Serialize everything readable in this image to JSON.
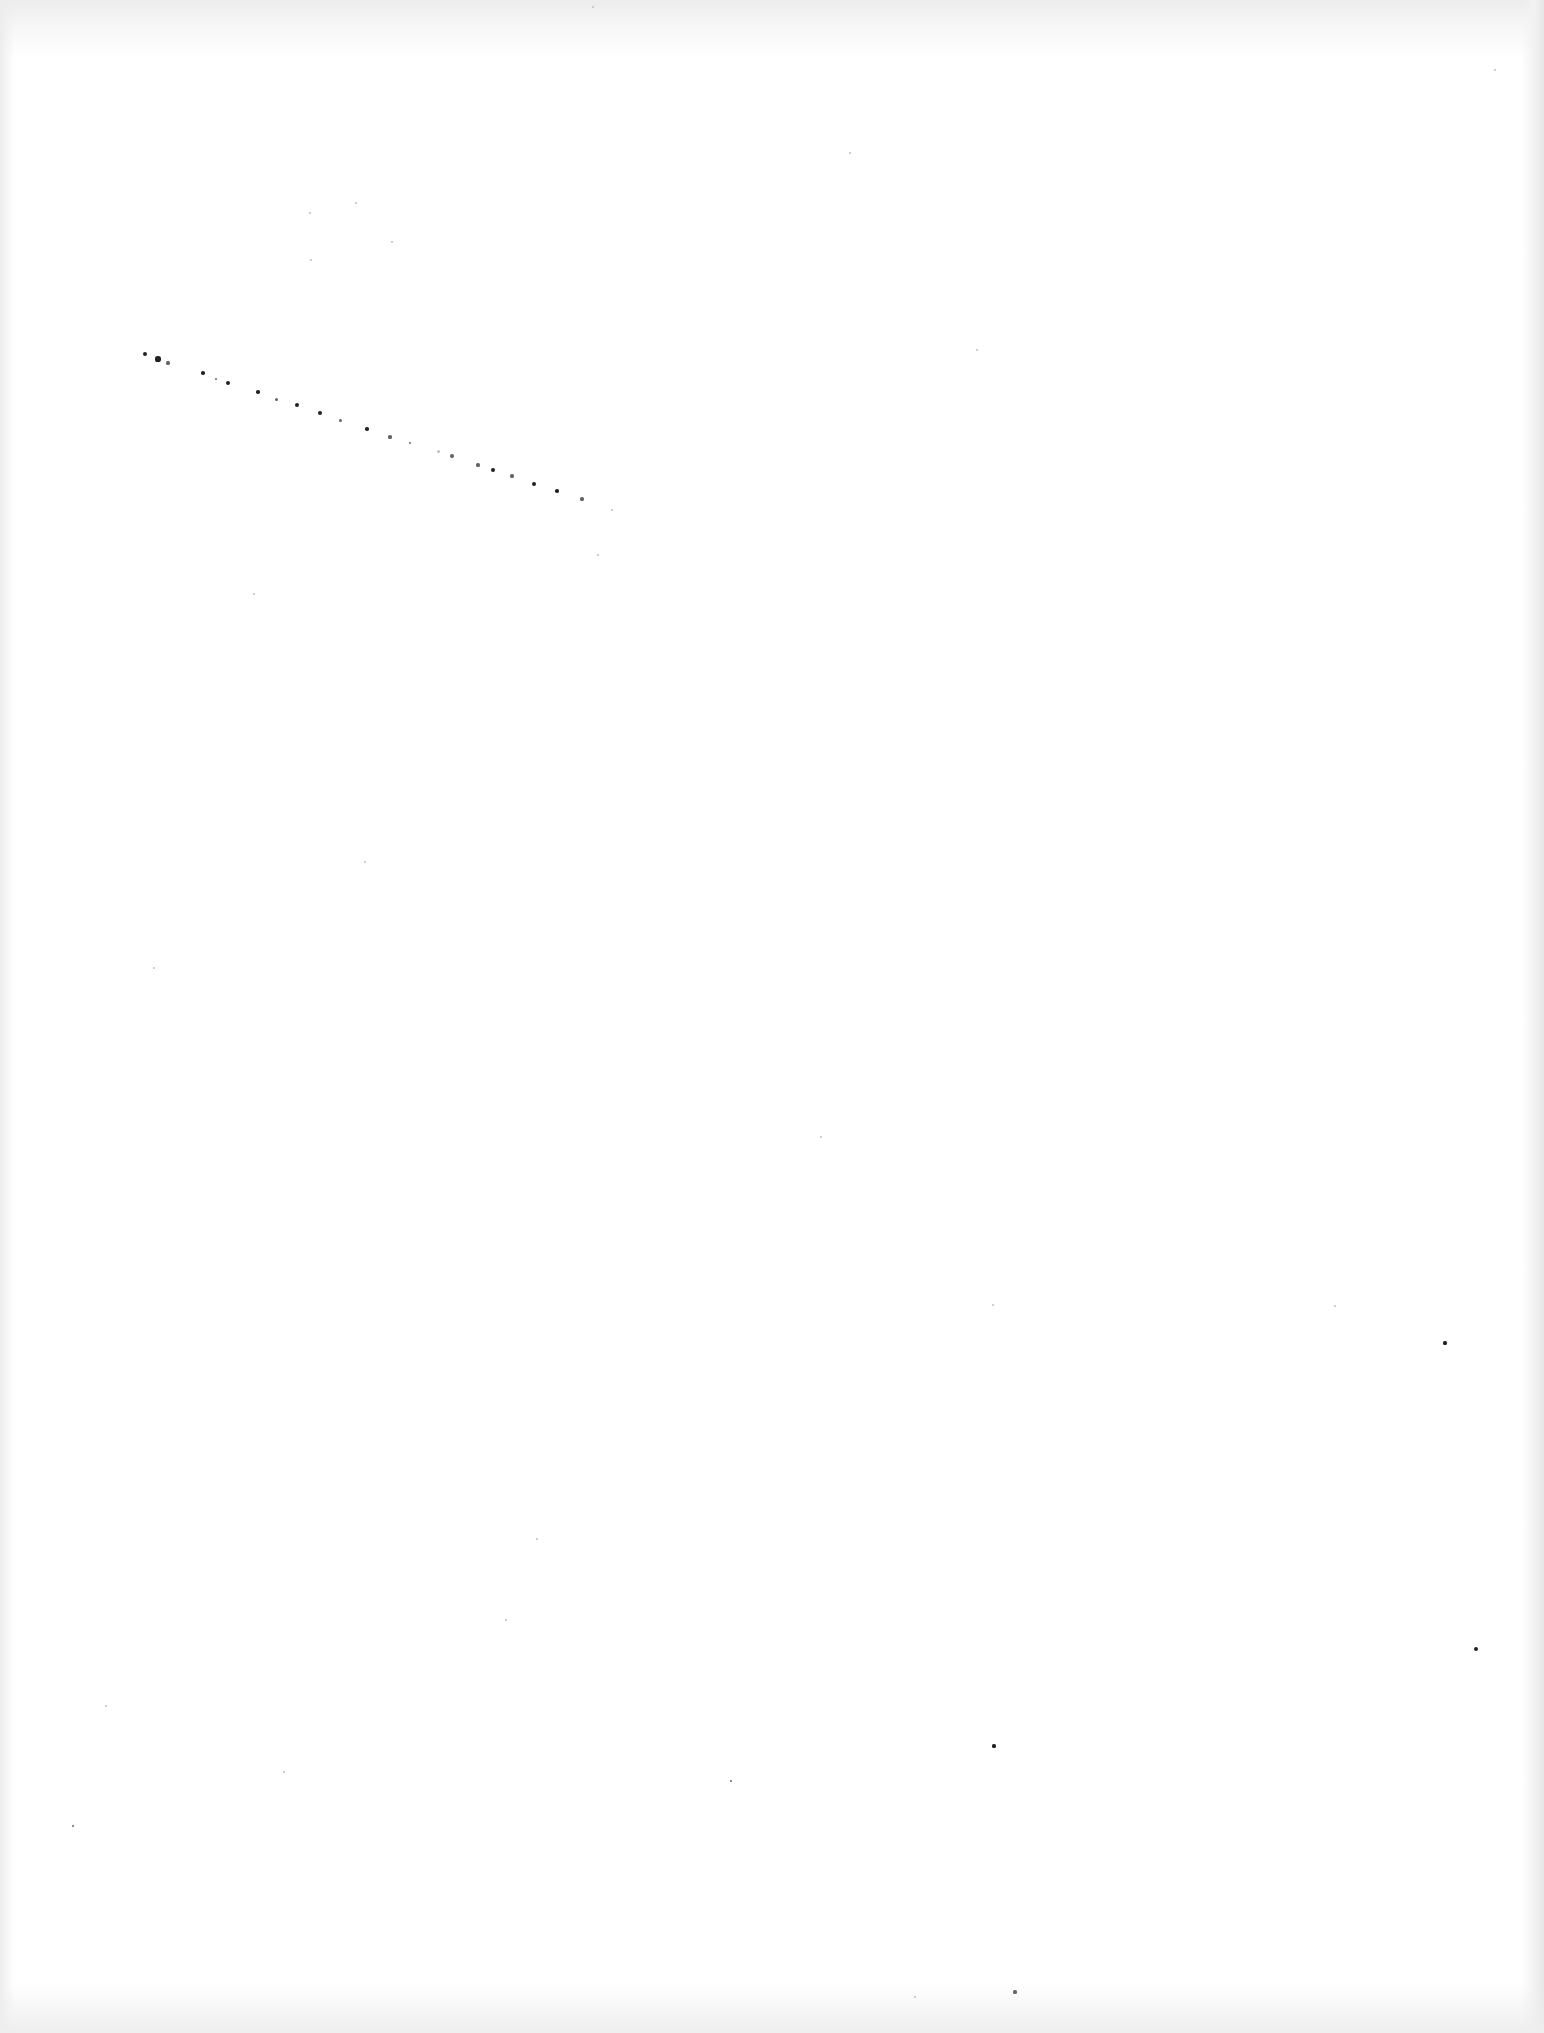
{
  "page": {
    "type": "blank-scanned-page",
    "background": "#ffffff",
    "edge_shade": "#e6e6e6",
    "speck_color": "#222222"
  },
  "speckle_trail": [
    [
      145,
      354,
      2.2,
      "dark"
    ],
    [
      158,
      359,
      2.6,
      "dark"
    ],
    [
      168,
      363,
      1.6,
      "mid"
    ],
    [
      203,
      373,
      1.8,
      "dark"
    ],
    [
      216,
      379,
      1.4,
      "mid"
    ],
    [
      228,
      383,
      2,
      "dark"
    ],
    [
      258,
      392,
      1.8,
      "dark"
    ],
    [
      276,
      399,
      1.5,
      "mid"
    ],
    [
      297,
      405,
      2,
      "dark"
    ],
    [
      320,
      413,
      2,
      "dark"
    ],
    [
      340,
      420,
      1.5,
      "mid"
    ],
    [
      367,
      429,
      1.8,
      "dark"
    ],
    [
      390,
      437,
      1.6,
      "mid"
    ],
    [
      410,
      443,
      1.4,
      "mid"
    ],
    [
      438,
      451,
      1.5,
      "faint"
    ],
    [
      452,
      456,
      1.8,
      "mid"
    ],
    [
      478,
      465,
      1.6,
      "mid"
    ],
    [
      493,
      470,
      1.9,
      "dark"
    ],
    [
      512,
      476,
      1.6,
      "mid"
    ],
    [
      534,
      484,
      1.9,
      "dark"
    ],
    [
      557,
      491,
      1.8,
      "dark"
    ],
    [
      582,
      499,
      1.6,
      "mid"
    ],
    [
      612,
      510,
      1.3,
      "faint"
    ]
  ],
  "dust_specks": [
    [
      356,
      203,
      1.2,
      "faint"
    ],
    [
      310,
      213,
      1,
      "faint"
    ],
    [
      392,
      242,
      1,
      "faint"
    ],
    [
      311,
      260,
      1,
      "faint"
    ],
    [
      850,
      153,
      1,
      "faint"
    ],
    [
      977,
      350,
      1,
      "faint"
    ],
    [
      598,
      555,
      1,
      "faint"
    ],
    [
      254,
      594,
      1,
      "faint"
    ],
    [
      365,
      862,
      1,
      "faint"
    ],
    [
      154,
      968,
      1,
      "faint"
    ],
    [
      821,
      1137,
      1,
      "faint"
    ],
    [
      993,
      1305,
      1.2,
      "faint"
    ],
    [
      1335,
      1306,
      1.2,
      "faint"
    ],
    [
      1445,
      1343,
      1.6,
      "dark"
    ],
    [
      537,
      1539,
      1,
      "faint"
    ],
    [
      506,
      1620,
      1,
      "faint"
    ],
    [
      106,
      1706,
      1.2,
      "faint"
    ],
    [
      284,
      1772,
      1,
      "faint"
    ],
    [
      731,
      1781,
      1.4,
      "mid"
    ],
    [
      73,
      1826,
      1.2,
      "mid"
    ],
    [
      1476,
      1649,
      2,
      "dark"
    ],
    [
      994,
      1746,
      1.6,
      "dark"
    ],
    [
      1015,
      1992,
      1.6,
      "mid"
    ],
    [
      915,
      1997,
      1,
      "faint"
    ],
    [
      593,
      7,
      1,
      "faint"
    ],
    [
      1495,
      70,
      1,
      "faint"
    ]
  ]
}
